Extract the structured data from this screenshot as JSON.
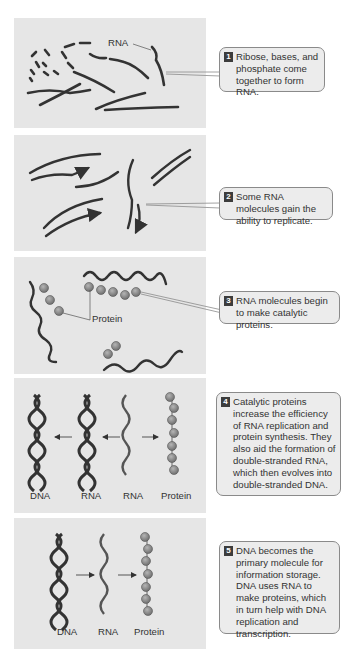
{
  "colors": {
    "panel_bg": "#e6e6e6",
    "callout_bg": "#ececec",
    "callout_border": "#8a8a8a",
    "strand": "#333333",
    "rna_strand": "#555555",
    "protein_bead": "#8a8a8a",
    "number_badge": "#3c3c3c"
  },
  "steps": [
    {
      "number": "1",
      "text": "Ribose, bases, and phosphate come together to form RNA.",
      "labels": [
        "RNA"
      ]
    },
    {
      "number": "2",
      "text": "Some RNA molecules gain the ability to replicate.",
      "labels": []
    },
    {
      "number": "3",
      "text": "RNA molecules begin to make catalytic proteins.",
      "labels": [
        "Protein"
      ]
    },
    {
      "number": "4",
      "text": "Catalytic proteins increase the efficiency of RNA replication and protein synthesis. They also aid the formation of double-stranded RNA, which then evolves into double-stranded DNA.",
      "labels": [
        "DNA",
        "RNA",
        "RNA",
        "Protein"
      ]
    },
    {
      "number": "5",
      "text": "DNA becomes the primary molecule for information storage. DNA uses RNA to make proteins, which in turn help with DNA replication and transcription.",
      "labels": [
        "DNA",
        "RNA",
        "Protein"
      ]
    }
  ]
}
